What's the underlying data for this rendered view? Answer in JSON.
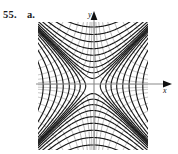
{
  "figure": {
    "problem_number": "55.",
    "part": "a.",
    "axis_labels": {
      "x": "x",
      "y": "y"
    },
    "colors": {
      "primary_curve": "#1a1a1a",
      "secondary_curve": "#b8b8b8",
      "axis": "#8a8a8a",
      "arrow": "#111111",
      "background": "#ffffff",
      "text": "#1b1b1b"
    }
  },
  "chart_data": {
    "type": "line",
    "title": "",
    "subtitle": "",
    "xlabel": "x",
    "ylabel": "y",
    "xlim": [
      -3.2,
      3.2
    ],
    "ylim": [
      -3.6,
      3.6
    ],
    "grid": false,
    "legend": null,
    "series": [
      {
        "name": "Family 1 (dark): x^2 - y^2 = k, opening along y",
        "color": "#1a1a1a",
        "equation": "x^2 - y^2 = k",
        "constants": [
          -0.18,
          -0.55,
          -1.1,
          -1.9,
          -3.0,
          -4.4,
          -6.2,
          -8.4,
          -11.0
        ]
      },
      {
        "name": "Family 2 (dark): x^2 - y^2 = k, opening along x",
        "color": "#1a1a1a",
        "equation": "x^2 - y^2 = k",
        "constants": [
          0.18,
          0.55,
          1.1,
          1.9,
          3.0,
          4.4,
          6.2,
          8.4,
          11.0
        ]
      },
      {
        "name": "Family 3 (gray): xy = c, quadrants I and III",
        "color": "#b8b8b8",
        "equation": "xy = c",
        "constants": [
          0.22,
          0.6,
          1.2,
          2.0,
          3.1,
          4.5,
          6.3,
          8.5
        ]
      },
      {
        "name": "Family 4 (gray): xy = c, quadrants II and IV",
        "color": "#b8b8b8",
        "equation": "xy = c",
        "constants": [
          -0.22,
          -0.6,
          -1.2,
          -2.0,
          -3.1,
          -4.5,
          -6.3,
          -8.5
        ]
      }
    ]
  }
}
